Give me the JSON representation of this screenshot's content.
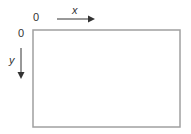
{
  "diagram": {
    "origin_x_label": "0",
    "origin_y_label": "0",
    "x_axis_label": "x",
    "y_axis_label": "y",
    "colors": {
      "frame": "#a0a0a0",
      "arrow": "#333333",
      "text": "#333333"
    }
  }
}
